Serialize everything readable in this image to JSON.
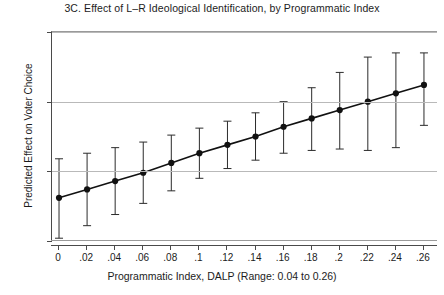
{
  "chart_data": {
    "type": "line",
    "title": "3C. Effect of L–R Ideological Identification, by Programmatic Index",
    "xlabel": "Programmatic Index, DALP (Range: 0.04 to 0.26)",
    "ylabel": "Predicted Effect on Voter Choice",
    "xlim": [
      -0.005,
      0.27
    ],
    "ylim": [
      -5,
      10
    ],
    "grid": true,
    "legend": false,
    "xticks": [
      0,
      0.02,
      0.04,
      0.06,
      0.08,
      0.1,
      0.12,
      0.14,
      0.16,
      0.18,
      0.2,
      0.22,
      0.24,
      0.26
    ],
    "xticklabels": [
      "0",
      ".02",
      ".04",
      ".06",
      ".08",
      ".1",
      ".12",
      ".14",
      ".16",
      ".18",
      ".2",
      ".22",
      ".24",
      ".26"
    ],
    "yticks": [
      -5,
      0,
      5,
      10
    ],
    "yticklabels": [
      "-5",
      "0",
      "5",
      "10"
    ],
    "x": [
      0,
      0.02,
      0.04,
      0.06,
      0.08,
      0.1,
      0.12,
      0.14,
      0.16,
      0.18,
      0.2,
      0.22,
      0.24,
      0.26
    ],
    "values": [
      -1.9,
      -1.3,
      -0.7,
      -0.1,
      0.6,
      1.3,
      1.9,
      2.5,
      3.2,
      3.8,
      4.4,
      5.0,
      5.6,
      6.2
    ],
    "ci_lower": [
      -4.8,
      -3.9,
      -3.1,
      -2.3,
      -1.4,
      -0.5,
      0.2,
      0.8,
      1.3,
      1.5,
      1.6,
      1.5,
      1.7,
      3.3
    ],
    "ci_upper": [
      0.9,
      1.3,
      1.7,
      2.1,
      2.6,
      3.1,
      3.6,
      4.2,
      5.0,
      6.0,
      7.1,
      8.2,
      8.5,
      8.5
    ],
    "series_name": "Predicted effect with 95% confidence interval",
    "marker": "filled-circle",
    "colors": {
      "line": "#111111",
      "marker": "#111111",
      "ci": "#2b2b2b",
      "grid": "#b9b9b9",
      "axis": "#4a4a4a",
      "background": "#ffffff"
    }
  }
}
